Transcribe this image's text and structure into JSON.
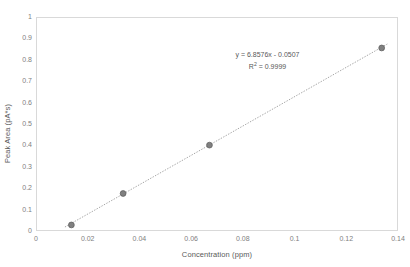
{
  "chart_data": {
    "type": "scatter",
    "title": "",
    "xlabel": "Concentration (ppm)",
    "ylabel": "Peak Area (pA*s)",
    "xlim": [
      0,
      0.14
    ],
    "ylim": [
      0,
      1
    ],
    "grid": false,
    "legend": "none",
    "x_ticklabels": [
      "0",
      "0.02",
      "0.04",
      "0.06",
      "0.08",
      "0.1",
      "0.12",
      "0.14"
    ],
    "x_tickvalues": [
      0,
      0.02,
      0.04,
      0.06,
      0.08,
      0.1,
      0.12,
      0.14
    ],
    "y_ticklabels": [
      "0",
      "0.1",
      "0.2",
      "0.3",
      "0.4",
      "0.5",
      "0.6",
      "0.7",
      "0.8",
      "0.9",
      "1"
    ],
    "y_tickvalues": [
      0,
      0.1,
      0.2,
      0.3,
      0.4,
      0.5,
      0.6,
      0.7,
      0.8,
      0.9,
      1
    ],
    "series": [
      {
        "name": "Calibration points",
        "x": [
          0.0133,
          0.0333,
          0.0667,
          0.1333
        ],
        "y": [
          0.033,
          0.18,
          0.406,
          0.86
        ]
      }
    ],
    "trendline": {
      "type": "linear",
      "style": "dotted",
      "slope": 6.8576,
      "intercept": -0.0507,
      "r_squared": 0.9999,
      "x_start": 0.0108,
      "x_end": 0.1355
    },
    "annotations": {
      "equation": "y = 6.8576x - 0.0507",
      "r_squared_prefix": "R",
      "r_squared_exponent": "2",
      "r_squared_value": " = 0.9999"
    },
    "colors": {
      "marker": "#808080",
      "marker_edge": "#595959",
      "trendline": "#a6a6a6",
      "axis_line": "#d9d9d9",
      "tick_label": "#808080",
      "axis_title": "#595959",
      "background": "#ffffff"
    }
  }
}
